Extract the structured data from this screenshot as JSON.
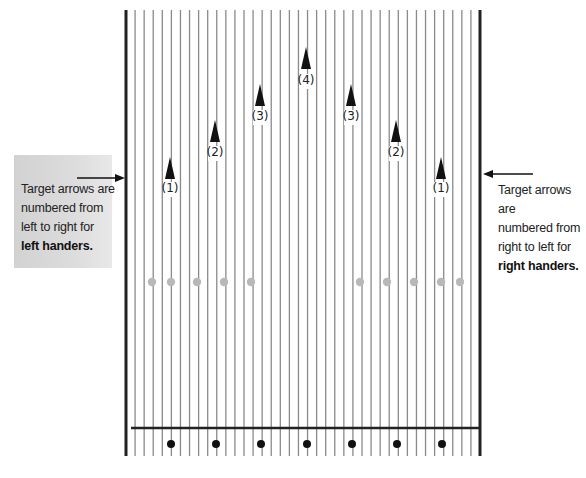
{
  "diagram": {
    "title": "",
    "left_note": {
      "line1": "Target arrows are",
      "line2": "numbered from",
      "line3": "left to right for",
      "line4_bold": "left handers."
    },
    "right_note": {
      "line1": "Target arrows are",
      "line2": "numbered from",
      "line3": "right to left for",
      "line4_bold": "right handers."
    },
    "target_arrows": [
      {
        "label": "(1)",
        "x": 170,
        "tip_y": 157,
        "label_y": 181
      },
      {
        "label": "(2)",
        "x": 215,
        "tip_y": 120,
        "label_y": 145
      },
      {
        "label": "(3)",
        "x": 260,
        "tip_y": 84,
        "label_y": 109
      },
      {
        "label": "(4)",
        "x": 306,
        "tip_y": 47,
        "label_y": 73
      },
      {
        "label": "(3)",
        "x": 351,
        "tip_y": 84,
        "label_y": 109
      },
      {
        "label": "(2)",
        "x": 396,
        "tip_y": 120,
        "label_y": 145
      },
      {
        "label": "(1)",
        "x": 441,
        "tip_y": 157,
        "label_y": 181
      }
    ],
    "range_finder_dots": {
      "y": 282,
      "xs": [
        152,
        171,
        197,
        224,
        251,
        360,
        387,
        414,
        441,
        460
      ],
      "color": "#b8b8b8"
    },
    "approach_dots": {
      "y": 444,
      "xs": [
        171,
        216,
        261,
        307,
        352,
        397,
        442
      ],
      "color": "#111111"
    },
    "lane": {
      "left_x": 126,
      "right_x": 480,
      "top_y": 10,
      "bottom_y": 456,
      "foul_line_y": 428,
      "boards": 39,
      "board_line_color": "#8a8a8a",
      "border_color": "#222222"
    },
    "pointer_arrows": {
      "left": {
        "x1": 77,
        "x2": 125,
        "y": 178
      },
      "right": {
        "x1": 533,
        "x2": 483,
        "y": 174
      }
    }
  }
}
